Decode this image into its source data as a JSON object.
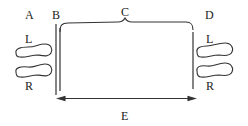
{
  "diagram": {
    "labels": {
      "a": "A",
      "b": "B",
      "c": "C",
      "d": "D",
      "e": "E",
      "left_foot_a": "L",
      "right_foot_a": "R",
      "left_foot_d": "L",
      "right_foot_d": "R"
    },
    "elements": {
      "start_line": "double vertical line (B)",
      "end_line": "single vertical line",
      "distance_brace": "brace C spanning from B to end line",
      "distance_arrow": "double-headed arrow E between lines",
      "footprints_start": "pair of footprints (L, R) at position A",
      "footprints_end": "pair of footprints (L, R) at position D"
    },
    "colors": {
      "stroke": "#333333",
      "text": "#222222",
      "background": "#ffffff"
    }
  }
}
